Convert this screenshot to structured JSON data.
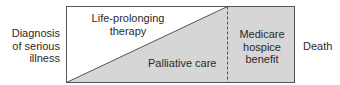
{
  "diagram": {
    "left_label": [
      "Diagnosis",
      "of serious",
      "illness"
    ],
    "right_label": "Death",
    "regions": {
      "life_prolonging": [
        "Life-prolonging",
        "therapy"
      ],
      "palliative": "Palliative care",
      "hospice": [
        "Medicare",
        "hospice",
        "benefit"
      ]
    },
    "colors": {
      "fill": "#d6d6d6",
      "border": "#555555",
      "background": "#ffffff"
    }
  }
}
